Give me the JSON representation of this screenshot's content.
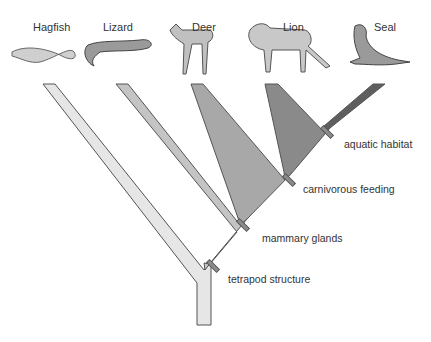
{
  "diagram": {
    "type": "cladogram",
    "taxa": [
      {
        "name": "Hagfish",
        "color": "#e6e6e6"
      },
      {
        "name": "Lizard",
        "color": "#b8b8b8"
      },
      {
        "name": "Deer",
        "color": "#9a9a9a"
      },
      {
        "name": "Lion",
        "color": "#7a7a7a"
      },
      {
        "name": "Seal",
        "color": "#5a5a5a"
      }
    ],
    "traits": [
      {
        "label": "tetrapod structure"
      },
      {
        "label": "mammary glands"
      },
      {
        "label": "carnivorous feeding"
      },
      {
        "label": "aquatic habitat"
      }
    ]
  }
}
